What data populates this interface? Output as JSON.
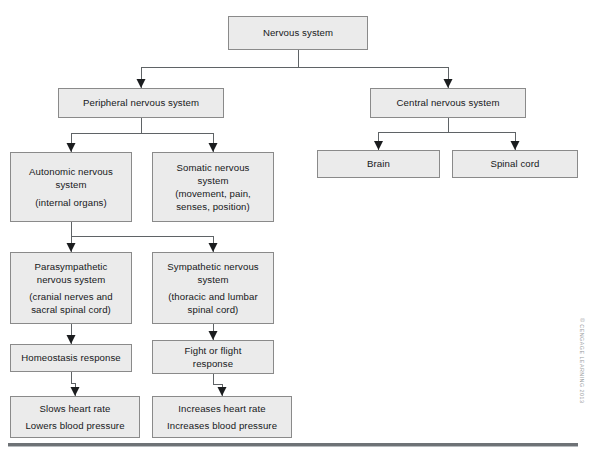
{
  "diagram": {
    "credit": "© CENGAGE LEARNING 2013",
    "colors": {
      "box_fill": "#ebebeb",
      "box_border": "#8a8a8a",
      "connector": "#5f6366",
      "text": "#16181a",
      "rule": "#6e7276",
      "credit_text": "#9a9ea1"
    },
    "nodes": [
      {
        "id": "nervous-system",
        "lines": [
          "Nervous system"
        ],
        "x": 228,
        "y": 16,
        "w": 140,
        "h": 34
      },
      {
        "id": "peripheral-nervous-system",
        "lines": [
          "Peripheral nervous system"
        ],
        "x": 58,
        "y": 88,
        "w": 166,
        "h": 30
      },
      {
        "id": "central-nervous-system",
        "lines": [
          "Central nervous system"
        ],
        "x": 370,
        "y": 88,
        "w": 156,
        "h": 30
      },
      {
        "id": "brain",
        "lines": [
          "Brain"
        ],
        "x": 317,
        "y": 150,
        "w": 123,
        "h": 28
      },
      {
        "id": "spinal-cord",
        "lines": [
          "Spinal cord"
        ],
        "x": 452,
        "y": 150,
        "w": 126,
        "h": 28
      },
      {
        "id": "autonomic-nervous-system",
        "lines": [
          "Autonomic nervous",
          "system",
          "",
          "(internal organs)"
        ],
        "x": 10,
        "y": 152,
        "w": 122,
        "h": 70
      },
      {
        "id": "somatic-nervous-system",
        "lines": [
          "Somatic nervous",
          "system",
          "(movement, pain,",
          "senses, position)"
        ],
        "x": 152,
        "y": 152,
        "w": 122,
        "h": 70
      },
      {
        "id": "parasympathetic-nervous-system",
        "lines": [
          "Parasympathetic",
          "nervous system",
          "",
          "(cranial nerves and",
          "sacral spinal cord)"
        ],
        "x": 10,
        "y": 252,
        "w": 122,
        "h": 72
      },
      {
        "id": "sympathetic-nervous-system",
        "lines": [
          "Sympathetic nervous",
          "system",
          "",
          "(thoracic and lumbar",
          "spinal cord)"
        ],
        "x": 152,
        "y": 252,
        "w": 122,
        "h": 72
      },
      {
        "id": "homeostasis-response",
        "lines": [
          "Homeostasis response"
        ],
        "x": 10,
        "y": 344,
        "w": 122,
        "h": 28
      },
      {
        "id": "fight-or-flight-response",
        "lines": [
          "Fight or flight",
          "response"
        ],
        "x": 152,
        "y": 340,
        "w": 122,
        "h": 34
      },
      {
        "id": "slows-heart-rate",
        "lines": [
          "Slows heart rate",
          "",
          "Lowers blood pressure"
        ],
        "x": 10,
        "y": 396,
        "w": 130,
        "h": 42
      },
      {
        "id": "increases-heart-rate",
        "lines": [
          "Increases heart rate",
          "",
          "Increases blood pressure"
        ],
        "x": 152,
        "y": 396,
        "w": 140,
        "h": 42
      }
    ],
    "edges": [
      {
        "from": "nervous-system",
        "to": "peripheral-nervous-system"
      },
      {
        "from": "nervous-system",
        "to": "central-nervous-system"
      },
      {
        "from": "peripheral-nervous-system",
        "to": "autonomic-nervous-system"
      },
      {
        "from": "peripheral-nervous-system",
        "to": "somatic-nervous-system"
      },
      {
        "from": "central-nervous-system",
        "to": "brain"
      },
      {
        "from": "central-nervous-system",
        "to": "spinal-cord"
      },
      {
        "from": "autonomic-nervous-system",
        "to": "parasympathetic-nervous-system"
      },
      {
        "from": "autonomic-nervous-system",
        "to": "sympathetic-nervous-system"
      },
      {
        "from": "parasympathetic-nervous-system",
        "to": "homeostasis-response"
      },
      {
        "from": "sympathetic-nervous-system",
        "to": "fight-or-flight-response"
      },
      {
        "from": "homeostasis-response",
        "to": "slows-heart-rate"
      },
      {
        "from": "fight-or-flight-response",
        "to": "increases-heart-rate"
      }
    ]
  }
}
